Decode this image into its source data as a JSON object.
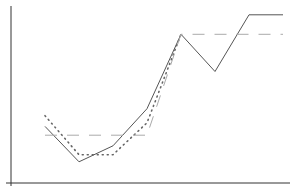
{
  "chart_data": {
    "type": "line",
    "title": "",
    "xlabel": "",
    "ylabel": "",
    "grid": false,
    "legend": null,
    "x": [
      1,
      2,
      3,
      4,
      5,
      6,
      7,
      8
    ],
    "ylim": [
      0,
      10
    ],
    "series": [
      {
        "name": "solid",
        "style": "solid",
        "color": "#555555",
        "values": [
          3.2,
          1.2,
          2.1,
          4.2,
          8.4,
          6.3,
          9.5,
          9.5
        ]
      },
      {
        "name": "dotted",
        "style": "dotted",
        "color": "#666666",
        "values": [
          3.8,
          1.6,
          1.6,
          3.4,
          8.4,
          null,
          null,
          null
        ]
      },
      {
        "name": "dashed",
        "style": "dashed",
        "color": "#aaaaaa",
        "values": [
          2.7,
          2.7,
          2.7,
          2.7,
          8.4,
          8.4,
          8.4,
          8.4
        ]
      }
    ]
  },
  "layout": {
    "axis_color": "#333333",
    "plot": {
      "x0": 45,
      "dx": 34,
      "y_base": 183,
      "y_top": 6
    }
  }
}
